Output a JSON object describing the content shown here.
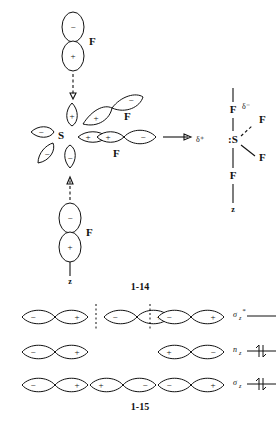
{
  "figure_1_14": {
    "caption": "1-14",
    "reactant": {
      "center_atom": "S",
      "center_lobes": [
        {
          "id": "up",
          "sign": "+"
        },
        {
          "id": "left",
          "sign": "−"
        },
        {
          "id": "lower-left",
          "sign": "−"
        },
        {
          "id": "down",
          "sign": "−"
        },
        {
          "id": "right-inner",
          "sign": "+"
        },
        {
          "id": "right-overlap",
          "sign": "+"
        }
      ],
      "incoming_fluorine": {
        "label": "F",
        "top_lobe_sign": "−",
        "bottom_lobe_sign": "+",
        "approach": "dashed-arrow-down"
      },
      "leaving_fluorine": {
        "label": "F",
        "top_lobe_sign": "−",
        "bottom_lobe_sign": "+",
        "axis_label": "z",
        "departure": "dashed-arrow-up"
      },
      "diagonal_fluorine": {
        "label": "F",
        "inner_lobe_sign": "+",
        "outer_lobe_sign": "−"
      },
      "equatorial_fluorine": {
        "label": "F",
        "inner_lobe_sign": "+",
        "outer_lobe_sign": "−"
      }
    },
    "reaction_arrow": "→",
    "product": {
      "center_atom": ":S",
      "center_charge": "δ⁺",
      "top_fluorine": {
        "label": "F",
        "charge": "δ⁻",
        "bond": "plain"
      },
      "upper_right_fluorine": {
        "label": "F",
        "bond": "dashed"
      },
      "lower_right_fluorine": {
        "label": "F",
        "bond": "plain"
      },
      "bottom_fluorine": {
        "label": "F",
        "bond": "plain"
      },
      "axis_label": "z"
    }
  },
  "figure_1_15": {
    "caption": "1-15",
    "rows": [
      {
        "mo_label": "σ",
        "mo_sub": "z",
        "mo_star": "*",
        "electrons": "",
        "nodes": 2,
        "orbitals": [
          {
            "left_sign": "−",
            "right_sign": "+"
          },
          {
            "left_sign": "−",
            "right_sign": "+"
          },
          {
            "left_sign": "−",
            "right_sign": "+"
          }
        ]
      },
      {
        "mo_label": "n",
        "mo_sub": "z",
        "mo_star": "",
        "electrons": "↑↓",
        "nodes": 0,
        "orbitals": [
          {
            "left_sign": "−",
            "right_sign": "+"
          },
          null,
          {
            "left_sign": "+",
            "right_sign": "−"
          }
        ]
      },
      {
        "mo_label": "σ",
        "mo_sub": "z",
        "mo_star": "",
        "electrons": "↑↓",
        "nodes": 0,
        "orbitals": [
          {
            "left_sign": "−",
            "right_sign": "+"
          },
          {
            "left_sign": "+",
            "right_sign": "−"
          },
          {
            "left_sign": "−",
            "right_sign": "+"
          }
        ]
      }
    ]
  },
  "colors": {
    "ink": "#111111",
    "paper": "#ffffff"
  }
}
